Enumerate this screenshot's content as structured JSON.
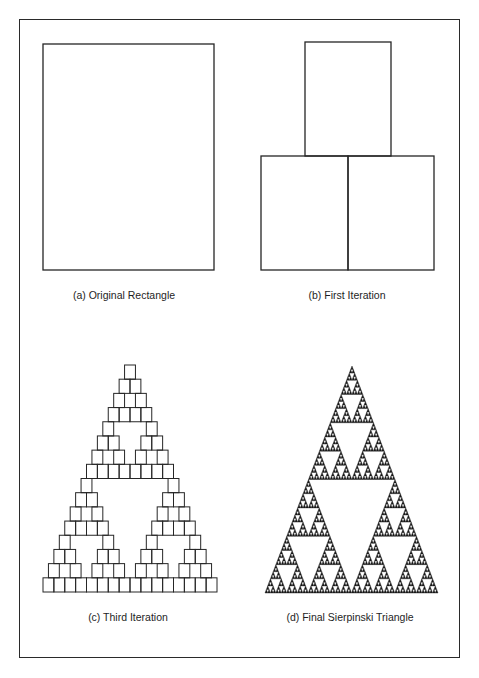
{
  "figure": {
    "panels": [
      {
        "id": "a",
        "caption": "(a)  Original Rectangle",
        "caption_x": 124,
        "caption_y": 289
      },
      {
        "id": "b",
        "caption": "(b)  First Iteration",
        "caption_x": 347,
        "caption_y": 289
      },
      {
        "id": "c",
        "caption": "(c)  Third Iteration",
        "caption_x": 128,
        "caption_y": 611
      },
      {
        "id": "d",
        "caption": "(d) Final Sierpinski Triangle",
        "caption_x": 350,
        "caption_y": 611
      }
    ],
    "original_rectangle": {
      "x": 43,
      "y": 44,
      "w": 171,
      "h": 226
    },
    "first_iteration": {
      "boxes": [
        {
          "x": 305,
          "y": 42,
          "w": 86,
          "h": 114
        },
        {
          "x": 261,
          "y": 156,
          "w": 87,
          "h": 114
        },
        {
          "x": 348,
          "y": 156,
          "w": 86,
          "h": 114
        }
      ]
    },
    "third_iteration": {
      "base_x": 43,
      "base_y": 592,
      "width": 174,
      "height": 227,
      "rows": 16
    },
    "final_triangle": {
      "apex_x": 352,
      "apex_y": 366,
      "base_left": 265,
      "base_right": 438,
      "base_y": 593,
      "depth": 6
    },
    "stroke_color": "#262626",
    "fill_color": "#1a1a1a"
  }
}
